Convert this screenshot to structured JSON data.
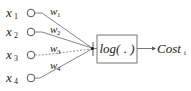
{
  "diagram": {
    "inputs": [
      {
        "label": "x",
        "sub": "1",
        "y": 13
      },
      {
        "label": "x",
        "sub": "2",
        "y": 32
      },
      {
        "label": "x",
        "sub": "3",
        "y": 55
      },
      {
        "label": "x",
        "sub": "4",
        "y": 78
      }
    ],
    "weights": [
      {
        "label": "w",
        "sub": "1"
      },
      {
        "label": "w",
        "sub": "2"
      },
      {
        "label": "w",
        "sub": "3"
      },
      {
        "label": "w",
        "sub": "4"
      }
    ],
    "function_box": {
      "label": "log( . )"
    },
    "output": {
      "label": "Cost",
      "sub": "i"
    },
    "colors": {
      "line": "#555555",
      "box_border": "#666666",
      "text": "#222222"
    }
  }
}
